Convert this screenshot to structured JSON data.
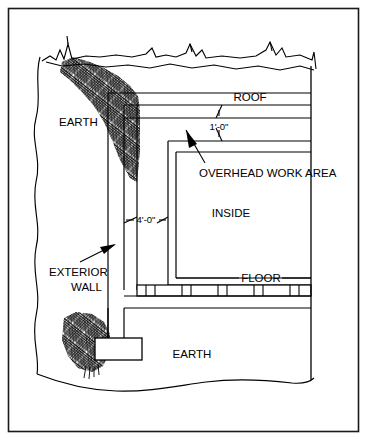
{
  "figure": {
    "type": "architectural-section-diagram",
    "border_color": "#1a1a1a",
    "line_color": "#000000",
    "background_color": "#ffffff"
  },
  "labels": {
    "earth_upper": "EARTH",
    "earth_lower": "EARTH",
    "roof": "ROOF",
    "overhead_work_area": "OVERHEAD WORK AREA",
    "inside": "INSIDE",
    "floor": "FLOOR",
    "exterior_wall_line1": "EXTERIOR",
    "exterior_wall_line2": "WALL"
  },
  "dimensions": {
    "overhead_clearance": "1'-0\"",
    "crawl_space_width": "4'-0\""
  },
  "annotations": [
    {
      "name": "overhead-work-area-leader",
      "icon": "arrow-up-left-icon",
      "points_to": "overhead work area void between roof and inside ceiling"
    },
    {
      "name": "exterior-wall-leader",
      "icon": "arrow-up-right-icon",
      "points_to": "exterior wall vertical member"
    },
    {
      "name": "roof-leader",
      "icon": "leader-line",
      "points_to": "roof assembly"
    },
    {
      "name": "floor-leader",
      "icon": "leader-line",
      "points_to": "floor assembly"
    }
  ],
  "elements": {
    "ground_line": "irregular jagged grade break line across top",
    "left_break_line": "wavy vertical break line at left edge",
    "bottom_break_line": "wavy horizontal break line at bottom",
    "earth_hatch": "dense crosshatch earth symbol",
    "footing": "rectangular concrete footing at base of exterior wall",
    "floor_joists": "segmented joist blocking band below floor"
  }
}
